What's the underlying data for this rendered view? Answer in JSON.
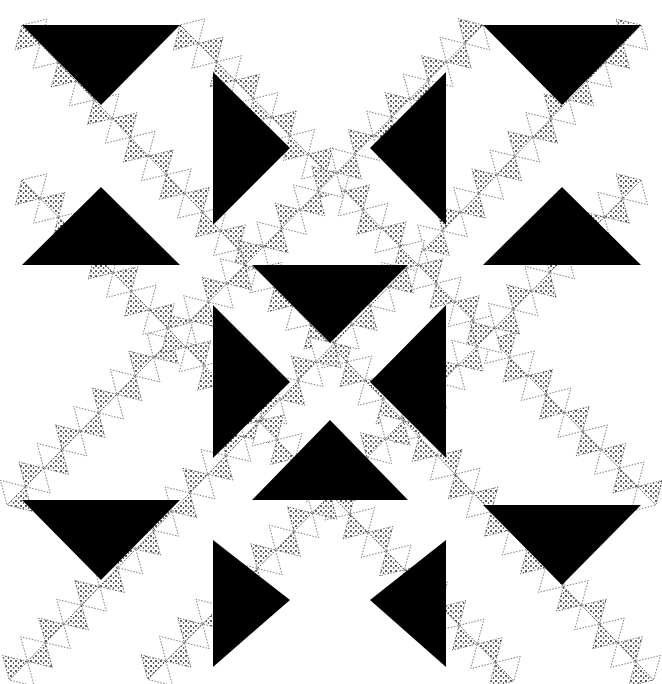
{
  "image": {
    "description": "Black and white quilt pattern illustration with solid black triangles and stippled (dotted) small triangle units arranged in diagonal bands",
    "colors": {
      "background": "#ffffff",
      "solid": "#000000",
      "stipple": "#111111"
    },
    "black_triangles": [
      {
        "points": "22,25 180,25 101,105"
      },
      {
        "points": "22,265 180,265 101,187"
      },
      {
        "points": "213,72 213,225 290,148"
      },
      {
        "points": "446,72 446,225 370,148"
      },
      {
        "points": "483,25 641,25 562,105"
      },
      {
        "points": "483,265 641,265 562,187"
      },
      {
        "points": "252,265 408,265 330,343"
      },
      {
        "points": "213,305 213,458 290,382"
      },
      {
        "points": "446,305 446,458 370,382"
      },
      {
        "points": "252,500 408,500 330,420"
      },
      {
        "points": "22,500 180,500 101,580"
      },
      {
        "points": "483,505 641,505 562,585"
      },
      {
        "points": "213,540 213,667 290,600"
      },
      {
        "points": "446,540 446,667 370,600"
      }
    ],
    "stipple_bands": [
      {
        "x1": 22,
        "y1": 25,
        "x2": 641,
        "y2": 667
      },
      {
        "x1": 641,
        "y1": 25,
        "x2": 22,
        "y2": 667
      },
      {
        "x1": 180,
        "y1": 25,
        "x2": 641,
        "y2": 490
      },
      {
        "x1": 483,
        "y1": 25,
        "x2": 22,
        "y2": 490
      },
      {
        "x1": 22,
        "y1": 180,
        "x2": 500,
        "y2": 667
      },
      {
        "x1": 641,
        "y1": 180,
        "x2": 160,
        "y2": 667
      }
    ]
  }
}
